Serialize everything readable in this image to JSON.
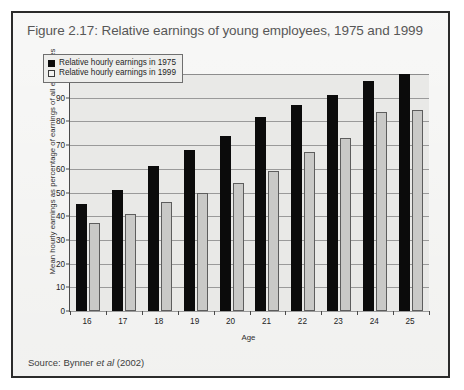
{
  "figure": {
    "title": "Figure 2.17: Relative earnings of young employees, 1975 and 1999",
    "source_prefix": "Source: Bynner ",
    "source_italic": "et al",
    "source_suffix": " (2002)"
  },
  "chart_data": {
    "type": "bar",
    "title": "Figure 2.17: Relative earnings of young employees, 1975 and 1999",
    "xlabel": "Age",
    "ylabel": "Mean hourly earnings as percentage of earnings of all employees",
    "categories": [
      "16",
      "17",
      "18",
      "19",
      "20",
      "21",
      "22",
      "23",
      "24",
      "25"
    ],
    "series": [
      {
        "name": "Relative hourly earnings in 1975",
        "color": "#0b0b0b",
        "values": [
          45,
          51,
          61,
          68,
          74,
          82,
          87,
          91,
          97,
          100
        ]
      },
      {
        "name": "Relative hourly earnings in 1999",
        "color": "#c9c9c7",
        "values": [
          37,
          41,
          46,
          50,
          54,
          59,
          67,
          73,
          84,
          85
        ]
      }
    ],
    "ylim": [
      0,
      100
    ],
    "yticks": [
      0,
      10,
      20,
      30,
      40,
      50,
      60,
      70,
      80,
      90,
      100
    ],
    "grid": true,
    "legend_position": "top-left"
  }
}
